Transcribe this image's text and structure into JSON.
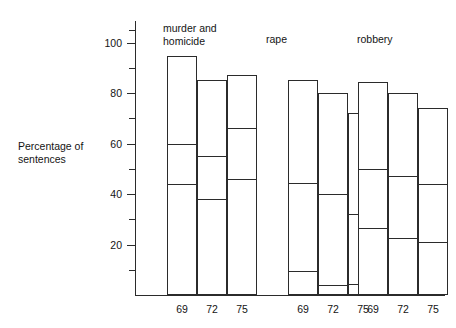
{
  "chart_data": {
    "type": "bar",
    "subtype": "stacked-segmented-outline",
    "title": "",
    "xlabel": "",
    "ylabel": "Percentage of\nsentences",
    "ylim": [
      0,
      105
    ],
    "yticks_major": [
      20,
      40,
      60,
      80,
      100
    ],
    "yticks_minor": [
      10,
      30,
      50,
      70,
      90,
      105
    ],
    "ytick_labels": [
      "20",
      "40",
      "60",
      "80",
      "100"
    ],
    "grid": false,
    "legend": null,
    "groups": [
      {
        "label": "murder and\nhomicide",
        "categories": [
          "69",
          "72",
          "75"
        ],
        "bars": [
          {
            "category": "69",
            "total": 94.5,
            "breakpoints": [
              44,
              60
            ],
            "segments": [
              44,
              16,
              34.5
            ]
          },
          {
            "category": "72",
            "total": 85.0,
            "breakpoints": [
              38,
              55
            ],
            "segments": [
              38,
              17,
              30
            ]
          },
          {
            "category": "75",
            "total": 87.0,
            "breakpoints": [
              46,
              66
            ],
            "segments": [
              46,
              20,
              21
            ]
          }
        ]
      },
      {
        "label": "rape",
        "categories": [
          "69",
          "72",
          "75"
        ],
        "bars": [
          {
            "category": "69",
            "total": 85.0,
            "breakpoints": [
              9.5,
              44.5
            ],
            "segments": [
              9.5,
              35,
              40.5
            ]
          },
          {
            "category": "72",
            "total": 80.0,
            "breakpoints": [
              4,
              40
            ],
            "segments": [
              4,
              36,
              40
            ]
          },
          {
            "category": "75",
            "total": 72.0,
            "breakpoints": [
              4.5,
              32
            ],
            "segments": [
              4.5,
              27.5,
              40
            ]
          }
        ]
      },
      {
        "label": "robbery",
        "categories": [
          "69",
          "72",
          "75"
        ],
        "bars": [
          {
            "category": "69",
            "total": 84.5,
            "breakpoints": [
              26.5,
              50
            ],
            "segments": [
              26.5,
              23.5,
              34.5
            ]
          },
          {
            "category": "72",
            "total": 80.0,
            "breakpoints": [
              22.5,
              47
            ],
            "segments": [
              22.5,
              24.5,
              33
            ]
          },
          {
            "category": "75",
            "total": 74.0,
            "breakpoints": [
              21,
              44
            ],
            "segments": [
              21,
              23,
              30
            ]
          }
        ]
      }
    ]
  },
  "colors": {
    "ink": "#2b2b2b",
    "text": "#141414",
    "bar_fill": "#ffffff",
    "background": "#ffffff"
  }
}
